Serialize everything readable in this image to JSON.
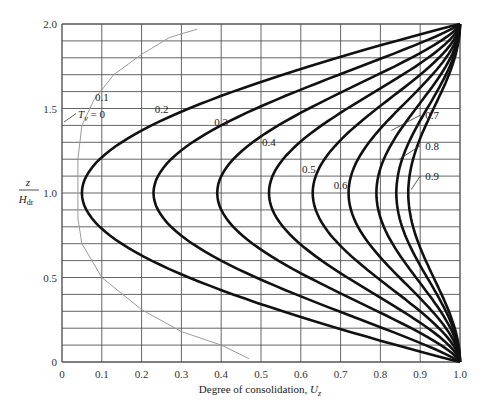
{
  "chart_data": {
    "type": "line",
    "title": "",
    "xlabel": "Degree of consolidation, U_z",
    "xlabel_main": "Degree of consolidation, ",
    "xlabel_var": "U",
    "xlabel_sub": "z",
    "ylabel": "z / H_dr",
    "ylabel_num": "z",
    "ylabel_den": "H",
    "ylabel_den_sub": "dr",
    "xlim": [
      0,
      1.0
    ],
    "ylim": [
      0,
      2.0
    ],
    "grid": true,
    "x_ticks": [
      "0",
      "0.1",
      "0.2",
      "0.3",
      "0.4",
      "0.5",
      "0.6",
      "0.7",
      "0.8",
      "0.9",
      "1.0"
    ],
    "y_ticks": [
      "0",
      "0.5",
      "1.0",
      "1.5",
      "2.0"
    ],
    "legend_position": "inline labels",
    "series_param": "T_v",
    "series": [
      {
        "name": "T_v = 0",
        "label": "= 0",
        "style": "thin gray",
        "points": [
          [
            0.47,
            0.02
          ],
          [
            0.4,
            0.1
          ],
          [
            0.3,
            0.18
          ],
          [
            0.2,
            0.31
          ],
          [
            0.1,
            0.5
          ],
          [
            0.05,
            0.7
          ],
          [
            0.04,
            0.85
          ],
          [
            0.04,
            1.0
          ],
          [
            0.04,
            1.2
          ],
          [
            0.05,
            1.4
          ],
          [
            0.08,
            1.55
          ],
          [
            0.13,
            1.7
          ],
          [
            0.2,
            1.82
          ],
          [
            0.27,
            1.92
          ],
          [
            0.34,
            1.97
          ]
        ]
      },
      {
        "name": "0.1",
        "min_Uz_at_mid": 0.05,
        "label": "0.1"
      },
      {
        "name": "0.2",
        "min_Uz_at_mid": 0.23,
        "label": "0.2"
      },
      {
        "name": "0.3",
        "min_Uz_at_mid": 0.39,
        "label": "0.3"
      },
      {
        "name": "0.4",
        "min_Uz_at_mid": 0.52,
        "label": "0.4"
      },
      {
        "name": "0.5",
        "min_Uz_at_mid": 0.63,
        "label": "0.5"
      },
      {
        "name": "0.6",
        "min_Uz_at_mid": 0.72,
        "label": "0.6"
      },
      {
        "name": "0.7",
        "min_Uz_at_mid": 0.79,
        "label": "0.7"
      },
      {
        "name": "0.8",
        "min_Uz_at_mid": 0.84,
        "label": "0.8"
      },
      {
        "name": "0.9",
        "min_Uz_at_mid": 0.87,
        "label": "0.9"
      }
    ],
    "annotations": [
      {
        "text": "0.1",
        "x": 0.1,
        "y": 1.57
      },
      {
        "text": "0.2",
        "x": 0.25,
        "y": 1.5
      },
      {
        "text": "0.3",
        "x": 0.4,
        "y": 1.42
      },
      {
        "text": "0.4",
        "x": 0.52,
        "y": 1.3
      },
      {
        "text": "0.5",
        "x": 0.62,
        "y": 1.14
      },
      {
        "text": "0.6",
        "x": 0.7,
        "y": 1.05
      },
      {
        "text": "0.7",
        "x": 0.93,
        "y": 1.46,
        "arrow_to": [
          0.82,
          1.37
        ]
      },
      {
        "text": "0.8",
        "x": 0.93,
        "y": 1.28,
        "arrow_to": [
          0.84,
          1.2
        ]
      },
      {
        "text": "0.9",
        "x": 0.93,
        "y": 1.1,
        "arrow_to": [
          0.87,
          1.02
        ]
      }
    ]
  },
  "colors": {
    "grid": "#555555",
    "curve": "#111111",
    "initial_curve": "#9a9a9a"
  }
}
